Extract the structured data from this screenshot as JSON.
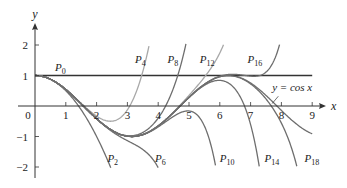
{
  "chart_data": {
    "type": "line",
    "title": "",
    "xlabel": "x",
    "ylabel": "y",
    "xlim": [
      0,
      9.6
    ],
    "ylim": [
      -2.3,
      2.8
    ],
    "grid": false,
    "x_ticks": [
      0,
      1,
      2,
      3,
      4,
      5,
      6,
      7,
      8,
      9
    ],
    "y_ticks": [
      -2,
      -1,
      1,
      2
    ],
    "x_tick_labels": [
      "0",
      "1",
      "2",
      "3",
      "4",
      "5",
      "6",
      "7",
      "8",
      "9"
    ],
    "y_tick_labels": [
      "−2",
      "−1",
      "1",
      "2"
    ],
    "series": [
      {
        "name": "y = cos x",
        "kind": "function",
        "func": "cos",
        "x_range": [
          0,
          9
        ],
        "color": "#6e6e6e"
      },
      {
        "name": "P0",
        "degree": 0,
        "x_range": [
          0,
          9
        ],
        "color": "#333333"
      },
      {
        "name": "P2",
        "degree": 2,
        "x_range": [
          0,
          3.0
        ],
        "color": "#6e6e6e"
      },
      {
        "name": "P4",
        "degree": 4,
        "x_range": [
          0,
          4.2
        ],
        "color": "#a8a8a8"
      },
      {
        "name": "P6",
        "degree": 6,
        "x_range": [
          0,
          4.6
        ],
        "color": "#6e6e6e"
      },
      {
        "name": "P8",
        "degree": 8,
        "x_range": [
          0,
          5.7
        ],
        "color": "#6e6e6e"
      },
      {
        "name": "P10",
        "degree": 10,
        "x_range": [
          0,
          6.2
        ],
        "color": "#6e6e6e"
      },
      {
        "name": "P12",
        "degree": 12,
        "x_range": [
          0,
          7.4
        ],
        "color": "#a8a8a8"
      },
      {
        "name": "P14",
        "degree": 14,
        "x_range": [
          0,
          7.8
        ],
        "color": "#6e6e6e"
      },
      {
        "name": "P16",
        "degree": 16,
        "x_range": [
          0,
          9.3
        ],
        "color": "#6e6e6e"
      },
      {
        "name": "P18",
        "degree": 18,
        "x_range": [
          0,
          9.4
        ],
        "color": "#6e6e6e"
      }
    ],
    "annotations": [
      {
        "text": "P",
        "sub": "0",
        "x": 0.65,
        "y": 1.15
      },
      {
        "text": "P",
        "sub": "2",
        "x": 2.35,
        "y": -1.85
      },
      {
        "text": "P",
        "sub": "4",
        "x": 3.25,
        "y": 1.4
      },
      {
        "text": "P",
        "sub": "6",
        "x": 3.9,
        "y": -1.85
      },
      {
        "text": "P",
        "sub": "8",
        "x": 4.3,
        "y": 1.4
      },
      {
        "text": "P",
        "sub": "10",
        "x": 6.0,
        "y": -1.85
      },
      {
        "text": "P",
        "sub": "12",
        "x": 5.35,
        "y": 1.4
      },
      {
        "text": "P",
        "sub": "14",
        "x": 7.45,
        "y": -1.85
      },
      {
        "text": "P",
        "sub": "16",
        "x": 6.9,
        "y": 1.4
      },
      {
        "text": "P",
        "sub": "18",
        "x": 8.75,
        "y": -1.85
      },
      {
        "text": "y = cos x",
        "x": 7.7,
        "y": 0.5
      }
    ]
  }
}
